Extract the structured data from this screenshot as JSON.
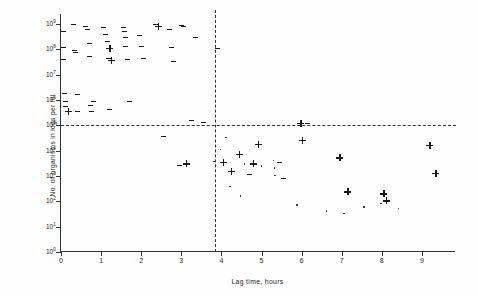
{
  "chart_data": {
    "type": "scatter",
    "title": "",
    "xlabel": "Lag time, hours",
    "ylabel": "No. of organisms in logs per ml",
    "xlim": [
      0,
      9.85
    ],
    "ylim": [
      0,
      9.4
    ],
    "grid": false,
    "legend": "none",
    "x_ticks": [
      0,
      1,
      2,
      3,
      4,
      5,
      6,
      7,
      8,
      9
    ],
    "x_tick_labels": [
      "0",
      "1",
      "2",
      "3",
      "4",
      "5",
      "6",
      "7",
      "8",
      "9"
    ],
    "y_ticks": [
      0,
      1,
      2,
      3,
      4,
      5,
      6,
      7,
      8,
      9
    ],
    "y_tick_labels": [
      "10",
      "10",
      "10",
      "10",
      "10",
      "10",
      "10",
      "10",
      "10",
      "10"
    ],
    "y_tick_exponents": [
      "0",
      "1",
      "2",
      "3",
      "4",
      "5",
      "6",
      "7",
      "8",
      "9"
    ],
    "y_scale": "log",
    "reference_lines": [
      {
        "orientation": "horizontal",
        "value": 5,
        "style": "dashed",
        "label": "10^5 threshold"
      },
      {
        "orientation": "vertical",
        "value": 3.85,
        "style": "dashed",
        "label": "4 hour threshold"
      }
    ],
    "marker_kinds": [
      "dash",
      "plus",
      "dot"
    ],
    "series": [
      {
        "name": "dash-markers",
        "marker": "dash",
        "points": [
          [
            0.05,
            8.72
          ],
          [
            0.05,
            8.05
          ],
          [
            0.05,
            7.58
          ],
          [
            0.08,
            6.25
          ],
          [
            0.1,
            5.92
          ],
          [
            0.12,
            5.72
          ],
          [
            0.3,
            8.98
          ],
          [
            0.33,
            7.95
          ],
          [
            0.35,
            7.88
          ],
          [
            0.4,
            6.22
          ],
          [
            0.42,
            5.55
          ],
          [
            0.62,
            8.88
          ],
          [
            0.66,
            8.78
          ],
          [
            0.7,
            8.22
          ],
          [
            0.72,
            7.7
          ],
          [
            0.74,
            5.78
          ],
          [
            0.76,
            5.55
          ],
          [
            0.8,
            5.92
          ],
          [
            1.05,
            8.85
          ],
          [
            1.1,
            8.58
          ],
          [
            1.15,
            8.32
          ],
          [
            1.18,
            7.62
          ],
          [
            1.22,
            5.62
          ],
          [
            1.55,
            8.85
          ],
          [
            1.58,
            8.72
          ],
          [
            1.6,
            8.45
          ],
          [
            1.62,
            8.1
          ],
          [
            1.66,
            7.58
          ],
          [
            1.7,
            5.95
          ],
          [
            1.95,
            8.55
          ],
          [
            2.0,
            8.12
          ],
          [
            2.05,
            7.62
          ],
          [
            2.35,
            8.98
          ],
          [
            2.4,
            8.88
          ],
          [
            2.7,
            8.78
          ],
          [
            2.75,
            8.08
          ],
          [
            2.8,
            7.52
          ],
          [
            3.0,
            8.95
          ],
          [
            3.05,
            8.88
          ],
          [
            3.25,
            5.2
          ],
          [
            3.55,
            5.12
          ],
          [
            3.35,
            8.45
          ],
          [
            3.9,
            8.02
          ],
          [
            6.15,
            5.05
          ],
          [
            2.55,
            4.55
          ],
          [
            2.95,
            3.42
          ],
          [
            4.7,
            3.05
          ],
          [
            5.55,
            2.88
          ],
          [
            5.45,
            3.52
          ]
        ]
      },
      {
        "name": "plus-markers",
        "marker": "plus",
        "points": [
          [
            0.18,
            5.55
          ],
          [
            1.22,
            8.05
          ],
          [
            1.25,
            7.58
          ],
          [
            2.42,
            8.92
          ],
          [
            4.05,
            3.55
          ],
          [
            4.25,
            3.18
          ],
          [
            4.45,
            3.85
          ],
          [
            4.8,
            3.48
          ],
          [
            4.92,
            4.25
          ],
          [
            5.98,
            5.08
          ],
          [
            6.02,
            4.42
          ],
          [
            6.95,
            3.72
          ],
          [
            7.15,
            2.38
          ],
          [
            8.05,
            2.3
          ],
          [
            8.12,
            2.02
          ],
          [
            9.2,
            4.22
          ],
          [
            9.35,
            3.12
          ],
          [
            3.12,
            3.48
          ]
        ]
      },
      {
        "name": "dot-markers",
        "marker": "dot",
        "points": [
          [
            4.12,
            4.52
          ],
          [
            4.58,
            3.48
          ],
          [
            5.0,
            3.4
          ],
          [
            5.3,
            3.62
          ],
          [
            5.32,
            3.32
          ],
          [
            5.34,
            3.02
          ],
          [
            4.22,
            2.58
          ],
          [
            4.48,
            2.22
          ],
          [
            5.88,
            1.85
          ],
          [
            6.62,
            1.62
          ],
          [
            7.55,
            1.78
          ],
          [
            7.98,
            1.92
          ],
          [
            8.42,
            1.72
          ],
          [
            7.05,
            1.52
          ],
          [
            3.98,
            4.05
          ],
          [
            3.82,
            3.58
          ]
        ]
      }
    ]
  },
  "axes": {
    "y_title": "No. of organisms in logs per ml",
    "x_title": "Lag time, hours",
    "y_base": "10"
  }
}
